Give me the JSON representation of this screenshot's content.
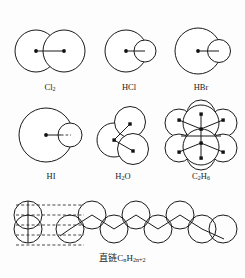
{
  "figure": {
    "title_caption": "直链CnH2n+2",
    "background_color": "#fdfdfd",
    "line_color": "#1a1a1a",
    "atom_fill": "#ffffff"
  },
  "row1": [
    {
      "id": "cl2",
      "label_main": "Cl",
      "label_sub": "2",
      "description": "two equal overlapping spheres with bond line between two dot centers"
    },
    {
      "id": "hcl",
      "label_main": "HCl",
      "label_sub": "",
      "description": "large sphere with small sphere overlapping at right, bond line from center dot"
    },
    {
      "id": "hbr",
      "label_main": "HBr",
      "label_sub": "",
      "description": "large sphere with small sphere overlapping at right, bond line from center dot"
    }
  ],
  "row2": [
    {
      "id": "hi",
      "label_main": "HI",
      "label_sub": "",
      "description": "largest sphere with small sphere at right, solid then dashed bond line"
    },
    {
      "id": "h2o",
      "label_main": "H",
      "label_sub": "2",
      "label_tail": "O",
      "description": "three overlapping spheres in zigzag with three dots joined by bonds"
    },
    {
      "id": "c2h6",
      "label_main": "C",
      "label_sub": "2",
      "label_tail": "H",
      "label_sub2": "6",
      "description": "ethane: two carbon spheres stacked with three hydrogen spheres each"
    }
  ],
  "bottom": {
    "id": "straight-chain-alkane",
    "label_prefix": "直链C",
    "label_sub1": "n",
    "label_mid": "H",
    "label_sub2": "2n+2",
    "description": "zigzag chain of overlapping spheres with dashed guide lines at left"
  }
}
